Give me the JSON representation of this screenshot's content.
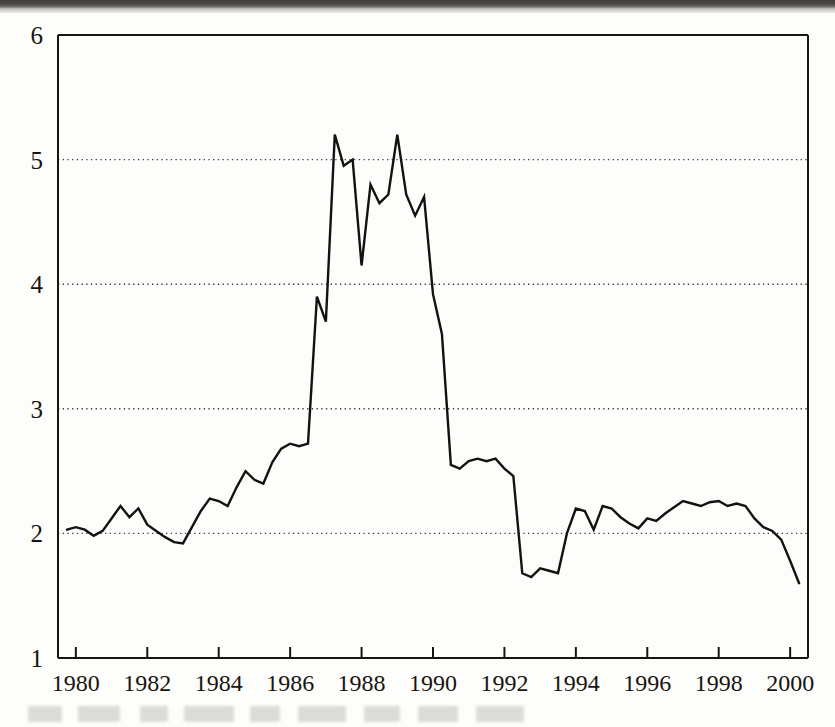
{
  "figure": {
    "background_color": "#fdfdfc",
    "ink_color": "#17150f",
    "gridline_color": "#3a3a3a",
    "series_color": "#121210"
  },
  "chart_data": {
    "type": "line",
    "title": "",
    "subtitle": "",
    "xlabel": "",
    "ylabel": "",
    "xlim": [
      1979.5,
      2000.5
    ],
    "ylim": [
      1,
      6
    ],
    "grid": true,
    "grid_axis": "y",
    "grid_style": "dotted",
    "gridline_values": [
      2,
      3,
      4,
      5
    ],
    "legend": "none",
    "x_tick_labels": [
      "1980",
      "1982",
      "1984",
      "1986",
      "1988",
      "1990",
      "1992",
      "1994",
      "1996",
      "1998",
      "2000"
    ],
    "x_tick_values": [
      1980,
      1982,
      1984,
      1986,
      1988,
      1990,
      1992,
      1994,
      1996,
      1998,
      2000
    ],
    "y_tick_labels": [
      "1",
      "2",
      "3",
      "4",
      "5",
      "6"
    ],
    "y_tick_values": [
      1,
      2,
      3,
      4,
      5,
      6
    ],
    "series": [
      {
        "name": "series-1",
        "color": "#121210",
        "x": [
          1979.75,
          1980.0,
          1980.25,
          1980.5,
          1980.75,
          1981.0,
          1981.25,
          1981.5,
          1981.75,
          1982.0,
          1982.25,
          1982.5,
          1982.75,
          1983.0,
          1983.25,
          1983.5,
          1983.75,
          1984.0,
          1984.25,
          1984.5,
          1984.75,
          1985.0,
          1985.25,
          1985.5,
          1985.75,
          1986.0,
          1986.25,
          1986.5,
          1986.75,
          1987.0,
          1987.25,
          1987.5,
          1987.75,
          1988.0,
          1988.25,
          1988.5,
          1988.75,
          1989.0,
          1989.25,
          1989.5,
          1989.75,
          1990.0,
          1990.25,
          1990.5,
          1990.75,
          1991.0,
          1991.25,
          1991.5,
          1991.75,
          1992.0,
          1992.25,
          1992.5,
          1992.75,
          1993.0,
          1993.25,
          1993.5,
          1993.75,
          1994.0,
          1994.25,
          1994.5,
          1994.75,
          1995.0,
          1995.25,
          1995.5,
          1995.75,
          1996.0,
          1996.25,
          1996.5,
          1996.75,
          1997.0,
          1997.25,
          1997.5,
          1997.75,
          1998.0,
          1998.25,
          1998.5,
          1998.75,
          1999.0,
          1999.25,
          1999.5,
          1999.75,
          2000.0,
          2000.25
        ],
        "y": [
          2.03,
          2.05,
          2.03,
          1.98,
          2.02,
          2.12,
          2.22,
          2.13,
          2.2,
          2.07,
          2.02,
          1.97,
          1.93,
          1.92,
          2.05,
          2.18,
          2.28,
          2.26,
          2.22,
          2.37,
          2.5,
          2.43,
          2.4,
          2.57,
          2.68,
          2.72,
          2.7,
          2.72,
          3.9,
          3.7,
          5.2,
          4.95,
          5.0,
          4.15,
          4.8,
          4.65,
          4.72,
          5.2,
          4.72,
          4.55,
          4.7,
          3.92,
          3.6,
          2.55,
          2.52,
          2.58,
          2.6,
          2.58,
          2.6,
          2.52,
          2.46,
          1.68,
          1.65,
          1.72,
          1.7,
          1.68,
          2.0,
          2.2,
          2.18,
          2.03,
          2.22,
          2.2,
          2.13,
          2.08,
          2.04,
          2.12,
          2.1,
          2.16,
          2.21,
          2.26,
          2.24,
          2.22,
          2.25,
          2.26,
          2.22,
          2.24,
          2.22,
          2.12,
          2.05,
          2.02,
          1.95,
          1.78,
          1.6
        ]
      }
    ]
  }
}
